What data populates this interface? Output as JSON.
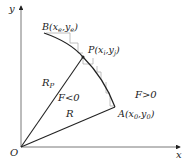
{
  "diagram": {
    "axes": {
      "x_label": "x",
      "y_label": "y",
      "origin_label": "O"
    },
    "points": {
      "A": {
        "label": "A(x0,y0)",
        "name": "A",
        "sub_x": "0",
        "sub_y": "0"
      },
      "B": {
        "label": "B(xe,ye)",
        "name": "B",
        "sub_x": "e",
        "sub_y": "e"
      },
      "P": {
        "label": "P(xi,yj)",
        "name": "P",
        "sub_x": "i",
        "sub_y": "j"
      }
    },
    "radii": {
      "R": "R",
      "Rp": "R",
      "Rp_sub": "P"
    },
    "regions": {
      "inside": "F<0",
      "outside": "F>0"
    },
    "colors": {
      "line": "#222222",
      "staircase": "#b0b0b0",
      "axis": "#555555"
    }
  }
}
